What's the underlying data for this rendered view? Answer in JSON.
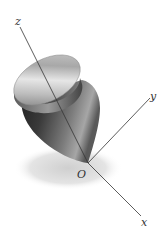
{
  "diagram": {
    "labels": {
      "z": "z",
      "y": "y",
      "x": "x",
      "origin": "O"
    },
    "colors": {
      "axis": "#333333",
      "disk_light": "#d8d8d8",
      "disk_dark": "#7a7a7a",
      "body_dark": "#2a2a2a",
      "body_mid": "#6a6a6a",
      "shadow": "#dcdcdc"
    }
  }
}
